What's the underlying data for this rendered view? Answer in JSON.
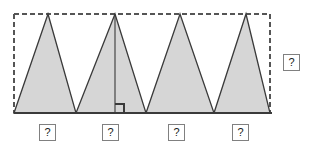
{
  "figure": {
    "colors": {
      "triangle_fill": "#d6d6d6",
      "triangle_stroke": "#3a3a3a",
      "dashed_stroke": "#555555",
      "baseline_stroke": "#3a3a3a",
      "label_border": "#808080",
      "label_text": "#1a1a1a",
      "background": "#ffffff"
    },
    "canvas": {
      "width": 311,
      "height": 150
    },
    "rectangle": {
      "left": 14,
      "top": 14,
      "right": 270,
      "bottom": 113,
      "style": "dashed",
      "dash_pattern": "5,3"
    },
    "baseline": {
      "x1": 14,
      "y1": 113,
      "x2": 272,
      "y2": 113
    },
    "triangles": [
      {
        "id": "triangle-1",
        "base_left": 14,
        "base_right": 76,
        "apex_x": 48,
        "apex_y": 14,
        "base_y": 113
      },
      {
        "id": "triangle-2",
        "base_left": 76,
        "base_right": 146,
        "apex_x": 115,
        "apex_y": 14,
        "base_y": 113
      },
      {
        "id": "triangle-3",
        "base_left": 146,
        "base_right": 214,
        "apex_x": 180,
        "apex_y": 14,
        "base_y": 113
      },
      {
        "id": "triangle-4",
        "base_left": 214,
        "base_right": 270,
        "apex_x": 246,
        "apex_y": 14,
        "base_y": 113
      }
    ],
    "altitude": {
      "triangle_id": "triangle-2",
      "x": 115,
      "y_top": 14,
      "y_bottom": 113,
      "right_angle_marker": {
        "x": 115,
        "y": 113,
        "size": 9,
        "side": "right"
      }
    },
    "labels": {
      "base_labels": [
        {
          "id": "base-label-1",
          "text": "?",
          "x": 39,
          "y": 124
        },
        {
          "id": "base-label-2",
          "text": "?",
          "x": 102,
          "y": 124
        },
        {
          "id": "base-label-3",
          "text": "?",
          "x": 168,
          "y": 124
        },
        {
          "id": "base-label-4",
          "text": "?",
          "x": 232,
          "y": 124
        }
      ],
      "height_label": {
        "id": "height-label",
        "text": "?",
        "x": 283,
        "y": 54
      }
    }
  }
}
